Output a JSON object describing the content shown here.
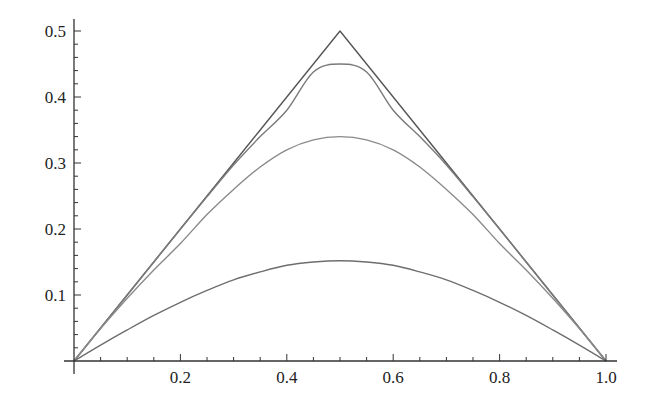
{
  "chart_data": {
    "type": "line",
    "title": "",
    "xlabel": "",
    "ylabel": "",
    "xlim": [
      0,
      1.0
    ],
    "ylim": [
      0,
      0.5
    ],
    "grid": false,
    "legend": null,
    "x_ticks": [
      0.2,
      0.4,
      0.6,
      0.8,
      1.0
    ],
    "x_tick_labels": [
      "0.2",
      "0.4",
      "0.6",
      "0.8",
      "1.0"
    ],
    "y_ticks": [
      0.1,
      0.2,
      0.3,
      0.4,
      0.5
    ],
    "y_tick_labels": [
      "0.1",
      "0.2",
      "0.3",
      "0.4",
      "0.5"
    ],
    "x": [
      0,
      0.05,
      0.1,
      0.15,
      0.2,
      0.25,
      0.3,
      0.35,
      0.4,
      0.45,
      0.5,
      0.55,
      0.6,
      0.65,
      0.7,
      0.75,
      0.8,
      0.85,
      0.9,
      0.95,
      1.0
    ],
    "series": [
      {
        "name": "curve-1-triangle",
        "color": "#555555",
        "values": [
          0,
          0.05,
          0.1,
          0.15,
          0.2,
          0.25,
          0.3,
          0.35,
          0.4,
          0.45,
          0.5,
          0.45,
          0.4,
          0.35,
          0.3,
          0.25,
          0.2,
          0.15,
          0.1,
          0.05,
          0
        ]
      },
      {
        "name": "curve-2",
        "color": "#7a7a7a",
        "values": [
          0,
          0.05,
          0.1,
          0.15,
          0.2,
          0.249,
          0.297,
          0.34,
          0.38,
          0.438,
          0.45,
          0.438,
          0.38,
          0.34,
          0.297,
          0.249,
          0.2,
          0.15,
          0.1,
          0.05,
          0
        ]
      },
      {
        "name": "curve-3",
        "color": "#8a8a8a",
        "values": [
          0,
          0.049,
          0.095,
          0.138,
          0.178,
          0.222,
          0.26,
          0.294,
          0.32,
          0.335,
          0.34,
          0.335,
          0.32,
          0.294,
          0.26,
          0.222,
          0.178,
          0.138,
          0.095,
          0.049,
          0
        ]
      },
      {
        "name": "curve-4",
        "color": "#6e6e6e",
        "values": [
          0,
          0.024,
          0.047,
          0.069,
          0.089,
          0.107,
          0.123,
          0.135,
          0.145,
          0.15,
          0.152,
          0.15,
          0.145,
          0.135,
          0.123,
          0.107,
          0.089,
          0.069,
          0.047,
          0.024,
          0
        ]
      }
    ]
  },
  "plot_area": {
    "origin_px": [
      74,
      361
    ],
    "x_scale_px_per_unit": 532,
    "y_scale_px_per_unit": 660,
    "axis_color": "#333333"
  }
}
